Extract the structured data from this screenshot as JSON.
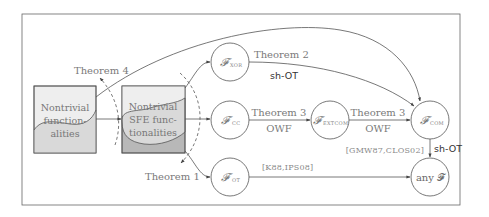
{
  "diagram": {
    "boxes": [
      {
        "id": "nontrivial",
        "lines": [
          "Nontrivial",
          "function-",
          "alities"
        ]
      },
      {
        "id": "nontrivial-sfe",
        "lines": [
          "Nontrivial",
          "SFE func-",
          "tionalities"
        ]
      }
    ],
    "nodes": {
      "xor": {
        "symbol": "𝓕",
        "sub": "XOR"
      },
      "cc": {
        "symbol": "𝓕",
        "sub": "CC"
      },
      "extcom": {
        "symbol": "𝓕",
        "sub": "EXTCOM"
      },
      "com": {
        "symbol": "𝓕",
        "sub": "COM"
      },
      "ot": {
        "symbol": "𝓕",
        "sub": "OT"
      },
      "anyf": {
        "label": "any 𝓕"
      }
    },
    "edge_labels": {
      "theorem4": "Theorem 4",
      "theorem1": "Theorem 1",
      "theorem2": "Theorem 2",
      "theorem2_assumption": "sh-OT",
      "theorem3a": "Theorem 3",
      "theorem3a_assumption": "OWF",
      "theorem3b": "Theorem 3",
      "theorem3b_assumption": "OWF",
      "gmw_cite": "[GMW87,CLOS02]",
      "gmw_assumption": "sh-OT",
      "kilian_cite": "[K88,IPS08]"
    },
    "colors": {
      "frame": "#555555",
      "box_light": "#ebebeb",
      "box_mid": "#d6d6d6",
      "box_dark": "#b4b4b4",
      "edge": "#555555"
    }
  }
}
